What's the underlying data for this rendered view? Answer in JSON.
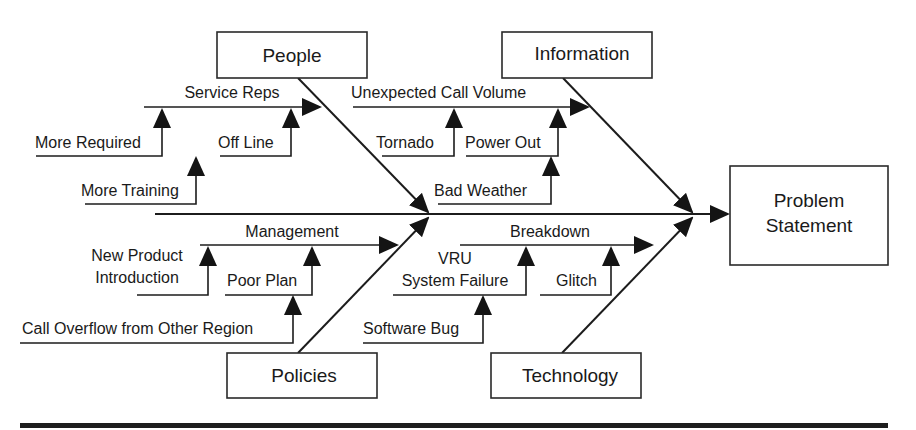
{
  "diagram": {
    "type": "fishbone",
    "effect": {
      "line1": "Problem",
      "line2": "Statement"
    },
    "categories": {
      "people": {
        "label": "People",
        "bone": {
          "label": "Service Reps",
          "causes": {
            "more_required": "More Required",
            "off_line": "Off Line",
            "more_training": "More Training"
          }
        }
      },
      "information": {
        "label": "Information",
        "bone": {
          "label": "Unexpected Call Volume",
          "causes": {
            "tornado": "Tornado",
            "power_out": "Power Out",
            "bad_weather": "Bad Weather"
          }
        }
      },
      "policies": {
        "label": "Policies",
        "bone": {
          "label": "Management",
          "causes": {
            "new_product_1": "New Product",
            "new_product_2": "Introduction",
            "poor_plan": "Poor Plan",
            "call_overflow": "Call Overflow from Other Region"
          }
        }
      },
      "technology": {
        "label": "Technology",
        "bone": {
          "label": "Breakdown",
          "causes": {
            "vru_1": "VRU",
            "vru_2": "System Failure",
            "glitch": "Glitch",
            "software_bug": "Software Bug"
          }
        }
      }
    },
    "colors": {
      "line": "#1c1c1c",
      "background": "#ffffff"
    }
  }
}
